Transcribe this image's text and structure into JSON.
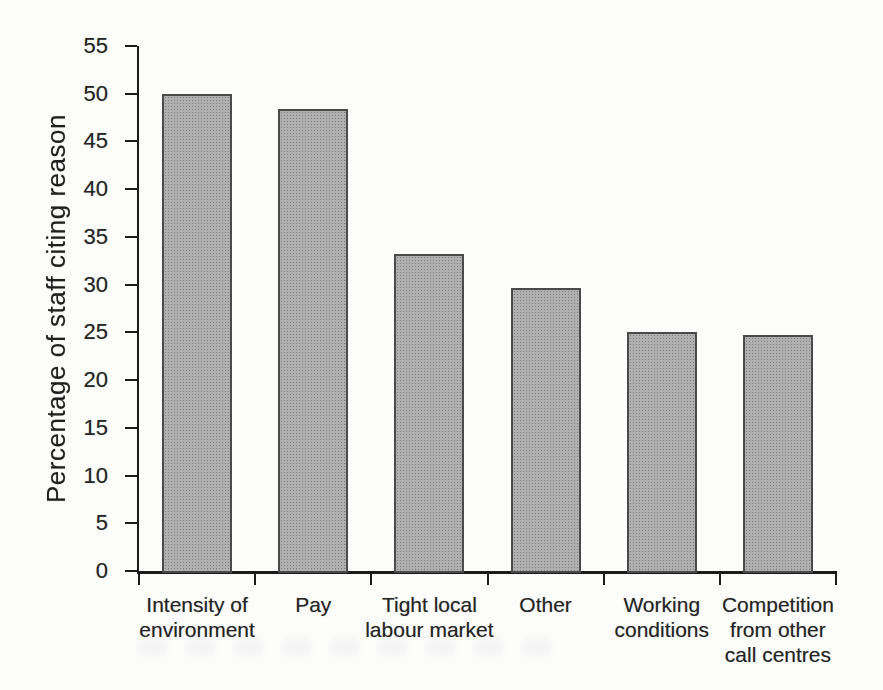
{
  "figure": {
    "background_color": "#fcfcfb"
  },
  "chart_data": {
    "type": "bar",
    "title": "",
    "categories": [
      "Intensity of\nenvironment",
      "Pay",
      "Tight local\nlabour market",
      "Other",
      "Working\nconditions",
      "Competition\nfrom other\ncall centres"
    ],
    "values": [
      50,
      48.4,
      33.2,
      29.7,
      25,
      24.7
    ],
    "xlabel": "",
    "ylabel": "Percentage of staff citing reason",
    "ylim": [
      0,
      55
    ],
    "yticks": [
      0,
      5,
      10,
      15,
      20,
      25,
      30,
      35,
      40,
      45,
      50,
      55
    ],
    "grid": false,
    "legend": null,
    "bar_fill_color": "#ababab",
    "bar_border_color": "#4a4a4a",
    "axis_color": "#1b1b1b",
    "text_color": "#242424"
  }
}
